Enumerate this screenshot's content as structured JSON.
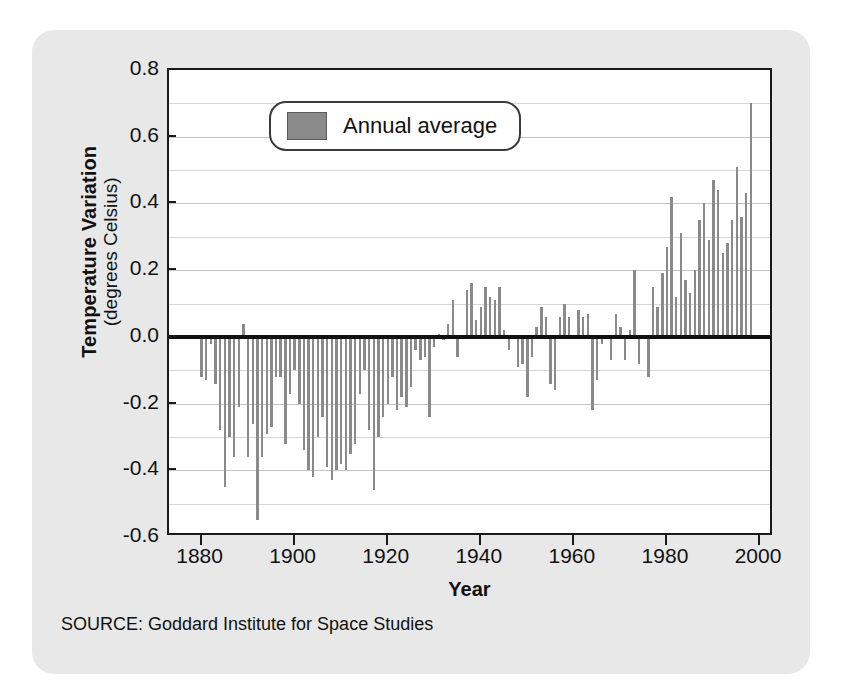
{
  "card": {
    "source_note": "SOURCE: Goddard Institute for Space Studies"
  },
  "legend": {
    "label": "Annual average",
    "swatch_color": "#8a8a8a",
    "position": "inside-top-left"
  },
  "axes": {
    "y_title_main": "Temperature Variation",
    "y_title_sub": "(degrees Celsius)",
    "x_title": "Year",
    "y_ticks": [
      "0.8",
      "0.6",
      "0.4",
      "0.2",
      "0.0",
      "-0.2",
      "-0.4",
      "-0.6"
    ],
    "x_ticks": [
      "1880",
      "1900",
      "1920",
      "1940",
      "1960",
      "1980",
      "2000"
    ]
  },
  "chart_data": {
    "type": "bar",
    "title": "",
    "subtitle": "",
    "xlabel": "Year",
    "ylabel": "Temperature Variation (degrees Celsius)",
    "xlim": [
      1873,
      2003
    ],
    "ylim": [
      -0.6,
      0.8
    ],
    "ytick_values": [
      0.8,
      0.6,
      0.4,
      0.2,
      0.0,
      -0.2,
      -0.4,
      -0.6
    ],
    "ytick_step": 0.2,
    "minor_gridline_step": 0.1,
    "xtick_values": [
      1880,
      1900,
      1920,
      1940,
      1960,
      1980,
      2000
    ],
    "grid": true,
    "grid_axis": "y",
    "zero_line": true,
    "bar_color": "#8a8a8a",
    "legend": [
      "Annual average"
    ],
    "legend_position": "upper left inside",
    "source": "Goddard Institute for Space Studies",
    "categories": [
      1880,
      1881,
      1882,
      1883,
      1884,
      1885,
      1886,
      1887,
      1888,
      1889,
      1890,
      1891,
      1892,
      1893,
      1894,
      1895,
      1896,
      1897,
      1898,
      1899,
      1900,
      1901,
      1902,
      1903,
      1904,
      1905,
      1906,
      1907,
      1908,
      1909,
      1910,
      1911,
      1912,
      1913,
      1914,
      1915,
      1916,
      1917,
      1918,
      1919,
      1920,
      1921,
      1922,
      1923,
      1924,
      1925,
      1926,
      1927,
      1928,
      1929,
      1930,
      1931,
      1932,
      1933,
      1934,
      1935,
      1936,
      1937,
      1938,
      1939,
      1940,
      1941,
      1942,
      1943,
      1944,
      1945,
      1946,
      1947,
      1948,
      1949,
      1950,
      1951,
      1952,
      1953,
      1954,
      1955,
      1956,
      1957,
      1958,
      1959,
      1960,
      1961,
      1962,
      1963,
      1964,
      1965,
      1966,
      1967,
      1968,
      1969,
      1970,
      1971,
      1972,
      1973,
      1974,
      1975,
      1976,
      1977,
      1978,
      1979,
      1980,
      1981,
      1982,
      1983,
      1984,
      1985,
      1986,
      1987,
      1988,
      1989,
      1990,
      1991,
      1992,
      1993,
      1994,
      1995,
      1996,
      1997,
      1998
    ],
    "values": [
      -0.12,
      -0.13,
      -0.02,
      -0.14,
      -0.28,
      -0.45,
      -0.3,
      -0.36,
      -0.21,
      0.04,
      -0.36,
      -0.26,
      -0.55,
      -0.36,
      -0.29,
      -0.27,
      -0.12,
      -0.12,
      -0.32,
      -0.17,
      -0.1,
      -0.2,
      -0.34,
      -0.4,
      -0.42,
      -0.3,
      -0.24,
      -0.39,
      -0.43,
      -0.4,
      -0.38,
      -0.4,
      -0.35,
      -0.32,
      -0.17,
      -0.1,
      -0.28,
      -0.46,
      -0.3,
      -0.24,
      -0.2,
      -0.12,
      -0.22,
      -0.18,
      -0.21,
      -0.15,
      -0.04,
      -0.07,
      -0.06,
      -0.24,
      -0.03,
      0.01,
      -0.01,
      0.04,
      0.11,
      -0.06,
      0.0,
      0.14,
      0.16,
      0.05,
      0.09,
      0.15,
      0.12,
      0.11,
      0.15,
      0.02,
      -0.04,
      0.0,
      -0.09,
      -0.08,
      -0.18,
      -0.06,
      0.03,
      0.09,
      0.06,
      -0.14,
      -0.16,
      0.06,
      0.1,
      0.06,
      0.0,
      0.08,
      0.06,
      0.07,
      -0.22,
      -0.13,
      -0.02,
      0.0,
      -0.07,
      0.07,
      0.03,
      -0.07,
      0.02,
      0.2,
      -0.08,
      0.0,
      -0.12,
      0.15,
      0.09,
      0.19,
      0.27,
      0.42,
      0.12,
      0.31,
      0.17,
      0.13,
      0.2,
      0.35,
      0.4,
      0.29,
      0.47,
      0.44,
      0.25,
      0.28,
      0.35,
      0.51,
      0.36,
      0.43,
      0.7
    ]
  }
}
